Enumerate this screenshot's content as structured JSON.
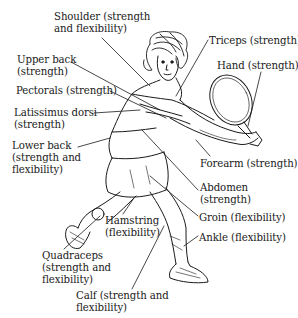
{
  "diagram": {
    "labels": [
      {
        "id": "shoulder",
        "text": "Shoulder (strength\nand flexibility)",
        "x": 54,
        "y": 11
      },
      {
        "id": "upper-back",
        "text": "Upper back\n(strength)",
        "x": 17,
        "y": 54
      },
      {
        "id": "pectorals",
        "text": "Pectorals (strength)",
        "x": 16,
        "y": 85
      },
      {
        "id": "latissimus-dorsi",
        "text": "Latissimus dorsi\n(strength)",
        "x": 14,
        "y": 107
      },
      {
        "id": "lower-back",
        "text": "Lower back\n(strength and\nflexibility)",
        "x": 12,
        "y": 140
      },
      {
        "id": "triceps",
        "text": "Triceps (strength)",
        "x": 209,
        "y": 35
      },
      {
        "id": "hand",
        "text": "Hand (strength)",
        "x": 217,
        "y": 60
      },
      {
        "id": "forearm",
        "text": "Forearm (strength)",
        "x": 200,
        "y": 158
      },
      {
        "id": "abdomen",
        "text": "Abdomen\n(strength)",
        "x": 200,
        "y": 182
      },
      {
        "id": "groin",
        "text": "Groin (flexibility)",
        "x": 199,
        "y": 212
      },
      {
        "id": "ankle",
        "text": "Ankle (flexibility)",
        "x": 199,
        "y": 232
      },
      {
        "id": "hamstring",
        "text": "Hamstring\n(flexibility)",
        "x": 105,
        "y": 215
      },
      {
        "id": "quadraceps",
        "text": "Quadraceps\n(strength and\nflexibility)",
        "x": 42,
        "y": 250
      },
      {
        "id": "calf",
        "text": "Calf (strength and\nflexibility)",
        "x": 76,
        "y": 290
      }
    ]
  }
}
